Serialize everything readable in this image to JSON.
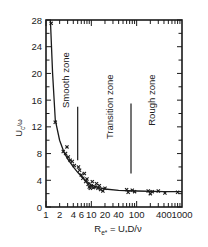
{
  "chart_data": {
    "type": "scatter",
    "title": "",
    "xlabel": "R_e* = U_* D / ν",
    "ylabel": "U_c / ω",
    "xscale": "log",
    "xlim": [
      1,
      1000
    ],
    "ylim": [
      0,
      28
    ],
    "grid": false,
    "legend": null,
    "x_ticks": [
      1,
      2,
      4,
      6,
      10,
      20,
      40,
      100,
      400,
      1000
    ],
    "x_tick_labels": [
      "1",
      "2",
      "4",
      "6",
      "10",
      "20",
      "40",
      "100",
      "400",
      "1000"
    ],
    "y_ticks": [
      0,
      4,
      8,
      12,
      16,
      20,
      24,
      28
    ],
    "y_tick_labels": [
      "0",
      "4",
      "8",
      "12",
      "16",
      "20",
      "24",
      "28"
    ],
    "annotations": [
      {
        "text": "Smooth zone",
        "x": 3.2,
        "y": 19,
        "rotation": -90
      },
      {
        "text": "Transition zone",
        "x": 30,
        "y": 15,
        "rotation": -90
      },
      {
        "text": "Rough zone",
        "x": 250,
        "y": 16,
        "rotation": -90
      }
    ],
    "zone_lines": [
      {
        "x": 5,
        "y_from": 7,
        "y_to": 15
      },
      {
        "x": 75,
        "y_from": 5,
        "y_to": 15.5
      }
    ],
    "series": [
      {
        "name": "measurements",
        "marker": "x",
        "points": [
          {
            "x": 1.3,
            "y": 27.5
          },
          {
            "x": 1.6,
            "y": 12.7
          },
          {
            "x": 2.4,
            "y": 8.3
          },
          {
            "x": 2.7,
            "y": 8.0
          },
          {
            "x": 2.9,
            "y": 9.0
          },
          {
            "x": 3.1,
            "y": 7.5
          },
          {
            "x": 3.4,
            "y": 7.0
          },
          {
            "x": 3.8,
            "y": 6.8
          },
          {
            "x": 4.2,
            "y": 6.2
          },
          {
            "x": 5.2,
            "y": 6.0
          },
          {
            "x": 5.5,
            "y": 5.5
          },
          {
            "x": 6.0,
            "y": 4.8
          },
          {
            "x": 6.5,
            "y": 4.3
          },
          {
            "x": 7.0,
            "y": 5.0
          },
          {
            "x": 7.5,
            "y": 3.8
          },
          {
            "x": 8.0,
            "y": 4.2
          },
          {
            "x": 8.5,
            "y": 3.4
          },
          {
            "x": 9.0,
            "y": 3.0
          },
          {
            "x": 9.5,
            "y": 2.8
          },
          {
            "x": 10.0,
            "y": 3.2
          },
          {
            "x": 10.5,
            "y": 3.8
          },
          {
            "x": 11.0,
            "y": 2.9
          },
          {
            "x": 12.0,
            "y": 3.0
          },
          {
            "x": 13.0,
            "y": 3.5
          },
          {
            "x": 14.0,
            "y": 2.8
          },
          {
            "x": 15.0,
            "y": 3.2
          },
          {
            "x": 16.0,
            "y": 2.6
          },
          {
            "x": 18.0,
            "y": 2.4
          },
          {
            "x": 20.0,
            "y": 2.8
          },
          {
            "x": 60.0,
            "y": 2.6
          },
          {
            "x": 65.0,
            "y": 2.2
          },
          {
            "x": 80.0,
            "y": 2.5
          },
          {
            "x": 90.0,
            "y": 2.3
          },
          {
            "x": 180.0,
            "y": 2.4
          },
          {
            "x": 200.0,
            "y": 2.0
          },
          {
            "x": 220.0,
            "y": 2.3
          },
          {
            "x": 300.0,
            "y": 2.4
          },
          {
            "x": 420.0,
            "y": 2.1
          },
          {
            "x": 800.0,
            "y": 2.2
          }
        ]
      },
      {
        "name": "fitted curve",
        "line": true,
        "points": [
          {
            "x": 1.25,
            "y": 28
          },
          {
            "x": 1.4,
            "y": 20
          },
          {
            "x": 1.6,
            "y": 13
          },
          {
            "x": 2.0,
            "y": 10
          },
          {
            "x": 2.5,
            "y": 8.2
          },
          {
            "x": 3.0,
            "y": 7.2
          },
          {
            "x": 4.0,
            "y": 6.0
          },
          {
            "x": 5.0,
            "y": 5.2
          },
          {
            "x": 6.0,
            "y": 4.6
          },
          {
            "x": 8.0,
            "y": 3.8
          },
          {
            "x": 10.0,
            "y": 3.3
          },
          {
            "x": 15.0,
            "y": 2.9
          },
          {
            "x": 20.0,
            "y": 2.7
          },
          {
            "x": 40.0,
            "y": 2.5
          },
          {
            "x": 100.0,
            "y": 2.4
          },
          {
            "x": 400.0,
            "y": 2.3
          },
          {
            "x": 1000.0,
            "y": 2.3
          }
        ]
      }
    ]
  },
  "labels": {
    "y_axis": "U",
    "y_axis_sub": "c",
    "y_axis_tail": "/ω",
    "x_axis_main": "R",
    "x_axis_sub": "e*",
    "x_axis_mid": " = U",
    "x_axis_sub2": "*",
    "x_axis_tail": "D/ν"
  }
}
